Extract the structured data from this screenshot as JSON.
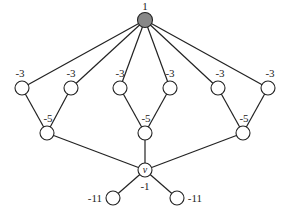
{
  "diagram": {
    "type": "tree-graph",
    "colors": {
      "root_fill": "#888888",
      "node_fill": "#ffffff",
      "stroke": "#222222"
    },
    "nodes": [
      {
        "id": "root",
        "x": 145,
        "y": 20,
        "r": 7.5,
        "label": "1",
        "lx": 145,
        "ly": 6,
        "root": true
      },
      {
        "id": "a1",
        "x": 22,
        "y": 88,
        "r": 7,
        "label": "-3",
        "lx": 20,
        "ly": 73
      },
      {
        "id": "a2",
        "x": 71,
        "y": 88,
        "r": 7,
        "label": "-3",
        "lx": 71,
        "ly": 73
      },
      {
        "id": "a3",
        "x": 120,
        "y": 88,
        "r": 7,
        "label": "-3",
        "lx": 120,
        "ly": 73
      },
      {
        "id": "a4",
        "x": 170,
        "y": 88,
        "r": 7,
        "label": "-3",
        "lx": 170,
        "ly": 73
      },
      {
        "id": "a5",
        "x": 218,
        "y": 88,
        "r": 7,
        "label": "-3",
        "lx": 220,
        "ly": 73
      },
      {
        "id": "a6",
        "x": 268,
        "y": 88,
        "r": 7,
        "label": "-3",
        "lx": 270,
        "ly": 73
      },
      {
        "id": "b1",
        "x": 47,
        "y": 133,
        "r": 7,
        "label": "-5",
        "lx": 48,
        "ly": 118
      },
      {
        "id": "b2",
        "x": 145,
        "y": 133,
        "r": 7,
        "label": "-5",
        "lx": 146,
        "ly": 118
      },
      {
        "id": "b3",
        "x": 243,
        "y": 133,
        "r": 7,
        "label": "-5",
        "lx": 244,
        "ly": 118
      },
      {
        "id": "v",
        "x": 145,
        "y": 170,
        "r": 7,
        "label": "-1",
        "lx": 145,
        "ly": 186,
        "inner": "v"
      },
      {
        "id": "c1",
        "x": 113,
        "y": 198,
        "r": 7,
        "label": "-11",
        "lx": 95,
        "ly": 198
      },
      {
        "id": "c2",
        "x": 177,
        "y": 198,
        "r": 7,
        "label": "-11",
        "lx": 195,
        "ly": 198
      }
    ],
    "edges": [
      [
        "root",
        "a1"
      ],
      [
        "root",
        "a2"
      ],
      [
        "root",
        "a3"
      ],
      [
        "root",
        "a4"
      ],
      [
        "root",
        "a5"
      ],
      [
        "root",
        "a6"
      ],
      [
        "a1",
        "b1"
      ],
      [
        "a2",
        "b1"
      ],
      [
        "a3",
        "b2"
      ],
      [
        "a4",
        "b2"
      ],
      [
        "a5",
        "b3"
      ],
      [
        "a6",
        "b3"
      ],
      [
        "b1",
        "v"
      ],
      [
        "b2",
        "v"
      ],
      [
        "b3",
        "v"
      ],
      [
        "v",
        "c1"
      ],
      [
        "v",
        "c2"
      ]
    ]
  }
}
